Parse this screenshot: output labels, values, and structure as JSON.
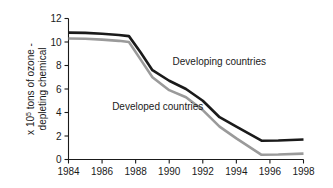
{
  "chart_data": {
    "type": "line",
    "title": "",
    "subtitle": "",
    "xlabel": "",
    "ylabel": "x 10⁵ tons of ozone - depleting chemical",
    "ylabel_lines": [
      "x 10",
      "5",
      " tons of ozone -",
      "depleting chemical"
    ],
    "ylabel_line1_pre": "x 10",
    "ylabel_line1_sup": "5",
    "ylabel_line1_post": " tons of ozone -",
    "ylabel_line2": "depleting chemical",
    "xlim": [
      1984,
      1998
    ],
    "ylim": [
      0,
      12
    ],
    "xticks": [
      1984,
      1986,
      1988,
      1990,
      1992,
      1994,
      1996,
      1998
    ],
    "xtick_labels": [
      "1984",
      "1986",
      "1988",
      "1990",
      "1992",
      "1994",
      "1996",
      "1998"
    ],
    "yticks": [
      0,
      2,
      4,
      6,
      8,
      10,
      12
    ],
    "ytick_labels": [
      "0",
      "2",
      "4",
      "6",
      "8",
      "10",
      "12"
    ],
    "grid": false,
    "legend_position": "inline-annotation",
    "spines": [
      "left",
      "bottom"
    ],
    "series": [
      {
        "name": "Developing countries",
        "color": "#1a1a1a",
        "stroke_width": 2.6,
        "annotation_label": "Developing countries",
        "annotation_x": 1990.2,
        "annotation_y": 8.05,
        "x": [
          1984,
          1985,
          1986,
          1987,
          1987.6,
          1988.3,
          1989,
          1990,
          1991,
          1992,
          1993,
          1994,
          1995.5,
          1996.5,
          1998
        ],
        "values": [
          10.8,
          10.78,
          10.7,
          10.6,
          10.5,
          9.1,
          7.6,
          6.7,
          6.0,
          5.0,
          3.6,
          2.8,
          1.6,
          1.62,
          1.7
        ]
      },
      {
        "name": "Developed countries",
        "color": "#9a9a9a",
        "stroke_width": 2.6,
        "annotation_label": "Developed countries",
        "annotation_x": 1986.6,
        "annotation_y": 4.2,
        "x": [
          1984,
          1985,
          1986,
          1987,
          1987.6,
          1988.3,
          1989,
          1990,
          1991,
          1992,
          1993,
          1994,
          1995.5,
          1996.5,
          1998
        ],
        "values": [
          10.3,
          10.28,
          10.2,
          10.1,
          10.0,
          8.5,
          7.0,
          5.9,
          5.3,
          4.2,
          2.8,
          1.8,
          0.4,
          0.42,
          0.5
        ]
      }
    ]
  }
}
